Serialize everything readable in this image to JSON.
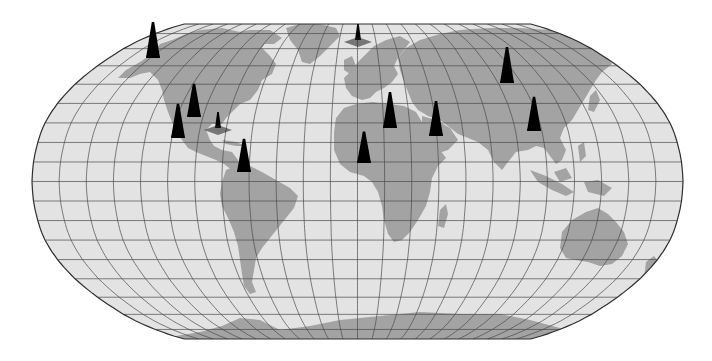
{
  "map": {
    "projection": "robinson-like",
    "graticule": {
      "parallel_spacing_deg": 10,
      "meridian_spacing_deg": 15
    },
    "colors": {
      "ocean": "#e3e3e3",
      "land": "#a3a3a3",
      "grid": "#4a4a4a",
      "outline": "#2e2e2e",
      "icon": "#1e1e1e",
      "background": "#ffffff"
    },
    "legend_label": "World map with oil derrick locations"
  },
  "markers": [
    {
      "id": "alaska",
      "type": "oil-derrick",
      "region": "Alaska",
      "x": 153,
      "top": 18,
      "base": 58
    },
    {
      "id": "us-west",
      "type": "oil-derrick",
      "region": "Western United States",
      "x": 178,
      "top": 100,
      "base": 138
    },
    {
      "id": "us-central",
      "type": "oil-derrick",
      "region": "Central United States",
      "x": 194,
      "top": 80,
      "base": 117
    },
    {
      "id": "gulf-of-mexico",
      "type": "offshore-platform",
      "region": "Gulf of Mexico",
      "x": 218,
      "top": 110,
      "base": 128
    },
    {
      "id": "venezuela",
      "type": "oil-derrick",
      "region": "Venezuela",
      "x": 244,
      "top": 135,
      "base": 172
    },
    {
      "id": "north-sea",
      "type": "offshore-platform",
      "region": "North Sea",
      "x": 358,
      "top": 22,
      "base": 40
    },
    {
      "id": "west-africa",
      "type": "oil-derrick",
      "region": "Algeria / West Africa",
      "x": 364,
      "top": 128,
      "base": 163
    },
    {
      "id": "libya",
      "type": "oil-derrick",
      "region": "Libya",
      "x": 390,
      "top": 88,
      "base": 128
    },
    {
      "id": "middle-east",
      "type": "oil-derrick",
      "region": "Middle East",
      "x": 436,
      "top": 97,
      "base": 136
    },
    {
      "id": "siberia",
      "type": "oil-derrick",
      "region": "Siberia",
      "x": 507,
      "top": 43,
      "base": 83
    },
    {
      "id": "china",
      "type": "oil-derrick",
      "region": "China",
      "x": 534,
      "top": 93,
      "base": 131
    }
  ]
}
